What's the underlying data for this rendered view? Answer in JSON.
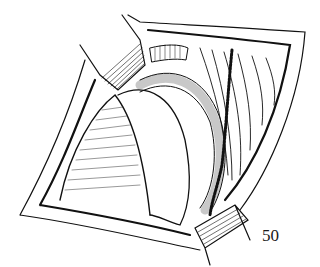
{
  "figure": {
    "number": "50",
    "ink_color": "#111111",
    "background_color": "#ffffff"
  }
}
